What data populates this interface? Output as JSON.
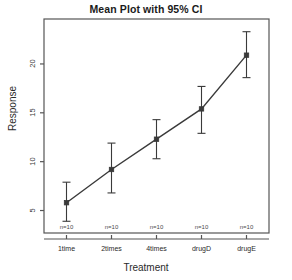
{
  "chart_data": {
    "type": "line",
    "title": "Mean Plot with 95% CI",
    "xlabel": "Treatment",
    "ylabel": "Response",
    "categories": [
      "1time",
      "2times",
      "4times",
      "drugD",
      "drugE"
    ],
    "values": [
      5.8,
      9.2,
      12.3,
      15.4,
      20.9
    ],
    "ci_lower": [
      3.9,
      6.8,
      10.3,
      12.9,
      18.6
    ],
    "ci_upper": [
      7.9,
      11.9,
      14.3,
      17.7,
      23.3
    ],
    "point_labels": [
      "n=10",
      "n=10",
      "n=10",
      "n=10",
      "n=10"
    ],
    "ytick_labels": [
      "5",
      "10",
      "15",
      "20"
    ],
    "ytick_values": [
      5,
      10,
      15,
      20
    ],
    "ylim": [
      2.7,
      24.6
    ],
    "xlim": [
      0.5,
      5.5
    ],
    "grid": false,
    "legend": null,
    "series_color": "#3a3a3a",
    "frame_color": "#555555",
    "marker": "square"
  },
  "axis_labels": {
    "x": "Treatment",
    "y": "Response"
  },
  "title": "Mean Plot with 95% CI"
}
